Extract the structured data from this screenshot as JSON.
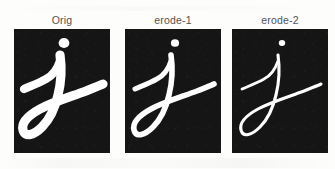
{
  "figure": {
    "name": "morphological-erosion-comparison",
    "background_color": "#fdfdfc",
    "panel_background_color": "#151515",
    "ink_color": "#ffffff",
    "label_color": "#53524f",
    "panel_count": 3,
    "panel_width": 96,
    "panel_height": 124
  },
  "panels": [
    {
      "label": "Orig",
      "glyph": "j",
      "stroke_width": 9.2,
      "dot_radius": 5.4,
      "erosion_level": 0
    },
    {
      "label": "erode-1",
      "glyph": "j",
      "stroke_width": 5.6,
      "dot_radius": 4.1,
      "erosion_level": 1
    },
    {
      "label": "erode-2",
      "glyph": "j",
      "stroke_width": 3.1,
      "dot_radius": 3.2,
      "erosion_level": 2
    }
  ],
  "glyph_geometry": {
    "dot_center_x": 50,
    "dot_center_y": 14,
    "stem_path": "M 46 26 C 48 40, 47 54, 44 66 C 41 79, 36 90, 28 98 C 20 106, 11 109, 9 101 C 7 93, 15 86, 26 80 C 39 73, 56 68, 72 62 C 79 59, 85 57, 89 55",
    "upstroke_path": "M 10 60 C 17 57, 25 54, 32 50 C 38 47, 43 41, 46 32"
  }
}
